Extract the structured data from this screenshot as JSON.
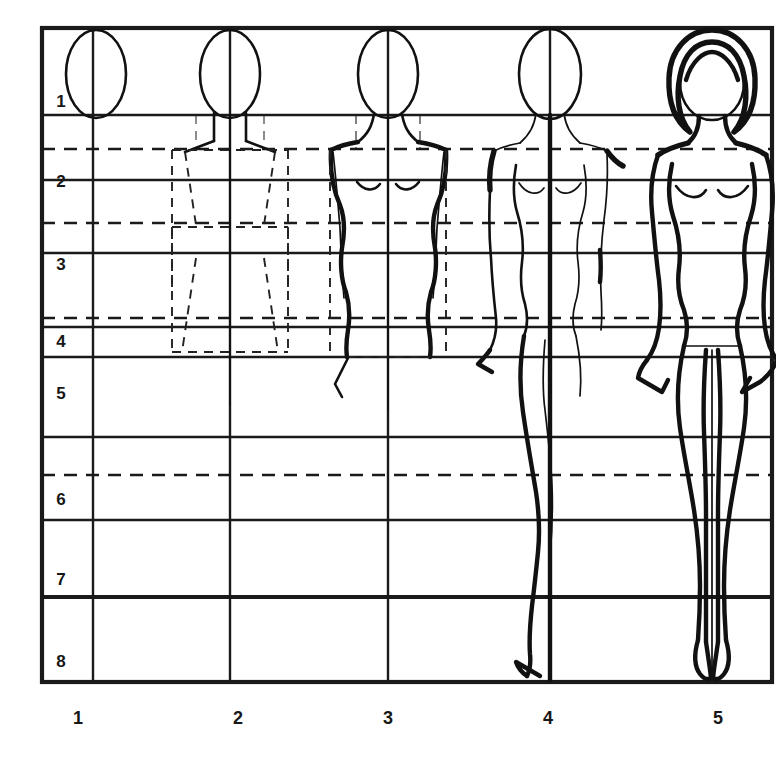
{
  "figure": {
    "ink_color": "#111111",
    "background_color": "#ffffff",
    "grid_line_color": "#1a1a1a",
    "dashed_line_color": "#1a1a1a"
  },
  "grid": {
    "bounds": {
      "left": 42,
      "top": 28,
      "right": 772,
      "bottom": 682
    },
    "row_labels": [
      "1",
      "2",
      "3",
      "4",
      "5",
      "6",
      "7",
      "8"
    ],
    "row_label_x": 60,
    "row_label_y": [
      100,
      182,
      265,
      342,
      396,
      500,
      580,
      662
    ],
    "column_labels": [
      "1",
      "2",
      "3",
      "4",
      "5"
    ],
    "column_label_y": 718,
    "column_label_x": [
      78,
      238,
      388,
      548,
      718
    ],
    "solid_horizontal_y": [
      28,
      115,
      180,
      253,
      327,
      437,
      520,
      597,
      682
    ],
    "dashed_horizontal_y": [
      149,
      223,
      290,
      318,
      475
    ],
    "solid_vertical_x": [
      42,
      93,
      230,
      388,
      550,
      772
    ],
    "head_unit_px": 82
  },
  "steps": [
    {
      "id": "step-1",
      "number": "1",
      "caption": "1",
      "center_x": 96,
      "content": "head oval only"
    },
    {
      "id": "step-2",
      "number": "2",
      "caption": "2",
      "center_x": 249,
      "content": "head plus dashed rectangular block construction for torso, hips and legs"
    },
    {
      "id": "step-3",
      "number": "3",
      "caption": "3",
      "center_x": 401,
      "content": "torso contour refined over construction lines, bust and waist shaped"
    },
    {
      "id": "step-4",
      "number": "4",
      "caption": "4",
      "center_x": 553,
      "content": "full body with arms and legs sketched to the ground line"
    },
    {
      "id": "step-5",
      "number": "5",
      "caption": "5",
      "center_x": 712,
      "content": "finished croquis with hair, smooth contours, hands and feet"
    }
  ]
}
